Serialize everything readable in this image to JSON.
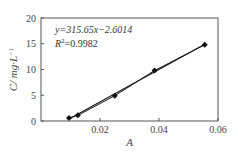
{
  "chart_data": {
    "type": "scatter",
    "title": "",
    "xlabel": "A",
    "ylabel": "C/ mg·L⁻¹",
    "xlim": [
      0,
      0.06
    ],
    "ylim": [
      0,
      20
    ],
    "xticks": [
      0.02,
      0.04,
      0.06
    ],
    "xtick_labels": [
      "0.02",
      "0.04",
      "0.06"
    ],
    "yticks": [
      0,
      5,
      10,
      15,
      20
    ],
    "ytick_labels": [
      "0",
      "5",
      "10",
      "15",
      "20"
    ],
    "grid": false,
    "legend": null,
    "series": [
      {
        "name": "calibration data",
        "marker": "diamond",
        "x": [
          0.0095,
          0.0125,
          0.025,
          0.0385,
          0.0555
        ],
        "y": [
          0.6,
          1.1,
          4.9,
          9.8,
          14.8
        ]
      },
      {
        "name": "linear fit",
        "type": "line",
        "slope": 315.65,
        "intercept": -2.6014
      }
    ],
    "annotations": [
      "y=315.65x−2.6014",
      "R²=0.9982"
    ]
  },
  "labels": {
    "equation": "y=315.65x−2.6014",
    "r2_prefix": "R",
    "r2_sup": "2",
    "r2_value": "=0.9982",
    "xlabel": "A",
    "ylabel_main": "C/ mg·L",
    "ylabel_sup": "−1"
  },
  "colors": {
    "line": "#1a1a1a",
    "marker": "#111111",
    "frame": "#555555",
    "text": "#444444"
  }
}
